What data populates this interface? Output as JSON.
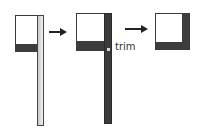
{
  "diagram": {
    "steps": [
      {
        "id": "step-1",
        "shape": "square with bottom band and long light vertical strip extending below"
      },
      {
        "id": "step-2",
        "shape": "square with bottom band and long dark vertical strip extending below, trim point marked"
      },
      {
        "id": "step-3",
        "shape": "square with dark bottom band and dark right column, strip trimmed"
      }
    ],
    "label": "trim",
    "colors": {
      "dark": "#3a3a3a",
      "light_strip": "#d8d8d8",
      "background": "#ffffff"
    }
  }
}
